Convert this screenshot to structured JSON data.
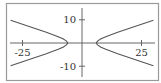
{
  "chart_data": {
    "type": "line",
    "title": "",
    "xlabel": "",
    "ylabel": "",
    "equation": "x^2/36 - y^2/4 = 1",
    "xlim": [
      -33,
      33
    ],
    "ylim": [
      -15,
      15
    ],
    "xticks": [
      -25,
      25
    ],
    "xtick_labels": [
      "-25",
      "25"
    ],
    "yticks": [
      10,
      -10
    ],
    "ytick_labels": [
      "10",
      "-10"
    ],
    "grid": false,
    "legend": null,
    "series": [
      {
        "name": "right branch",
        "x": [
          30,
          25,
          20,
          15,
          10,
          8,
          6.5,
          6,
          6.5,
          8,
          10,
          15,
          20,
          25,
          30
        ],
        "y": [
          9.8,
          8.1,
          6.4,
          4.6,
          2.7,
          1.8,
          0.8,
          0,
          -0.8,
          -1.8,
          -2.7,
          -4.6,
          -6.4,
          -8.1,
          -9.8
        ]
      },
      {
        "name": "left branch",
        "x": [
          -30,
          -25,
          -20,
          -15,
          -10,
          -8,
          -6.5,
          -6,
          -6.5,
          -8,
          -10,
          -15,
          -20,
          -25,
          -30
        ],
        "y": [
          9.8,
          8.1,
          6.4,
          4.6,
          2.7,
          1.8,
          0.8,
          0,
          -0.8,
          -1.8,
          -2.7,
          -4.6,
          -6.4,
          -8.1,
          -9.8
        ]
      }
    ],
    "colors": {
      "curve": "#555555",
      "axis": "#666666",
      "frame": "#999999"
    }
  }
}
